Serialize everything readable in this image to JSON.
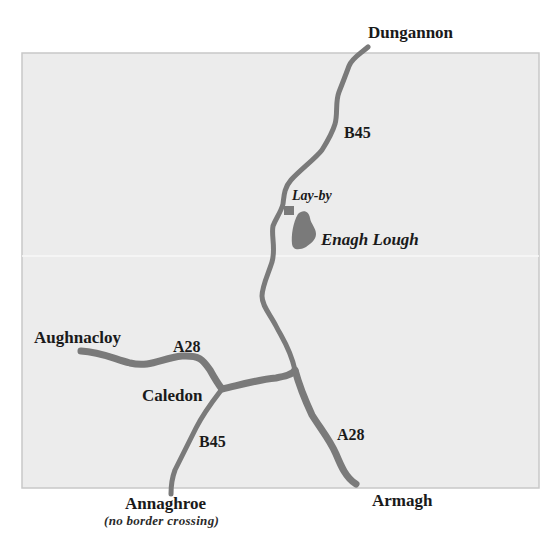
{
  "map": {
    "background_color": "#ececec",
    "road_color": "#7a7a7a",
    "lake_color": "#7a7a7a",
    "towns": {
      "dungannon": "Dungannon",
      "aughnacloy": "Aughnacloy",
      "caledon": "Caledon",
      "annaghroe": "Annaghroe",
      "armagh": "Armagh"
    },
    "annaghroe_note": "(no border crossing)",
    "features": {
      "layby": "Lay-by",
      "lake": "Enagh Lough"
    },
    "road_labels": {
      "b45_north": "B45",
      "a28_west": "A28",
      "b45_south": "B45",
      "a28_south": "A28"
    }
  }
}
